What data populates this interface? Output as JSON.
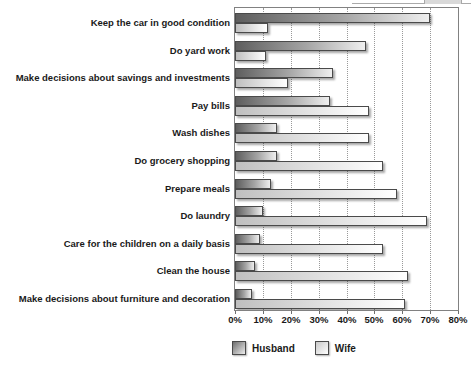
{
  "chart_data": {
    "type": "bar",
    "orientation": "horizontal",
    "title": "",
    "xlabel": "",
    "ylabel": "",
    "categories": [
      "Keep the car in good condition",
      "Do yard work",
      "Make decisions about savings and investments",
      "Pay bills",
      "Wash dishes",
      "Do grocery shopping",
      "Prepare meals",
      "Do laundry",
      "Care for the children on a daily basis",
      "Clean the house",
      "Make decisions about furniture and decoration"
    ],
    "series": [
      {
        "name": "Husband",
        "values": [
          70,
          47,
          35,
          34,
          15,
          15,
          13,
          10,
          9,
          7,
          6
        ]
      },
      {
        "name": "Wife",
        "values": [
          12,
          11,
          19,
          48,
          48,
          53,
          58,
          69,
          53,
          62,
          61
        ]
      }
    ],
    "xlim": [
      0,
      80
    ],
    "x_tick_values": [
      0,
      10,
      20,
      30,
      40,
      50,
      60,
      70,
      80
    ],
    "x_tick_labels": [
      "0%",
      "10%",
      "20%",
      "30%",
      "40%",
      "50%",
      "60%",
      "70%",
      "80%"
    ],
    "grid": "vertical-dotted",
    "legend_position": "bottom-center"
  },
  "legend": {
    "husband_label": "Husband",
    "wife_label": "Wife"
  },
  "colors": {
    "husband_bar_start": "#5e5e5e",
    "husband_bar_end": "#efefef",
    "wife_bar_start": "#bfbfbf",
    "wife_bar_end": "#ffffff",
    "bar_outline": "#4a4a4a",
    "plot_border": "#818181",
    "gridline": "#999999",
    "text": "#1a1a1a"
  }
}
